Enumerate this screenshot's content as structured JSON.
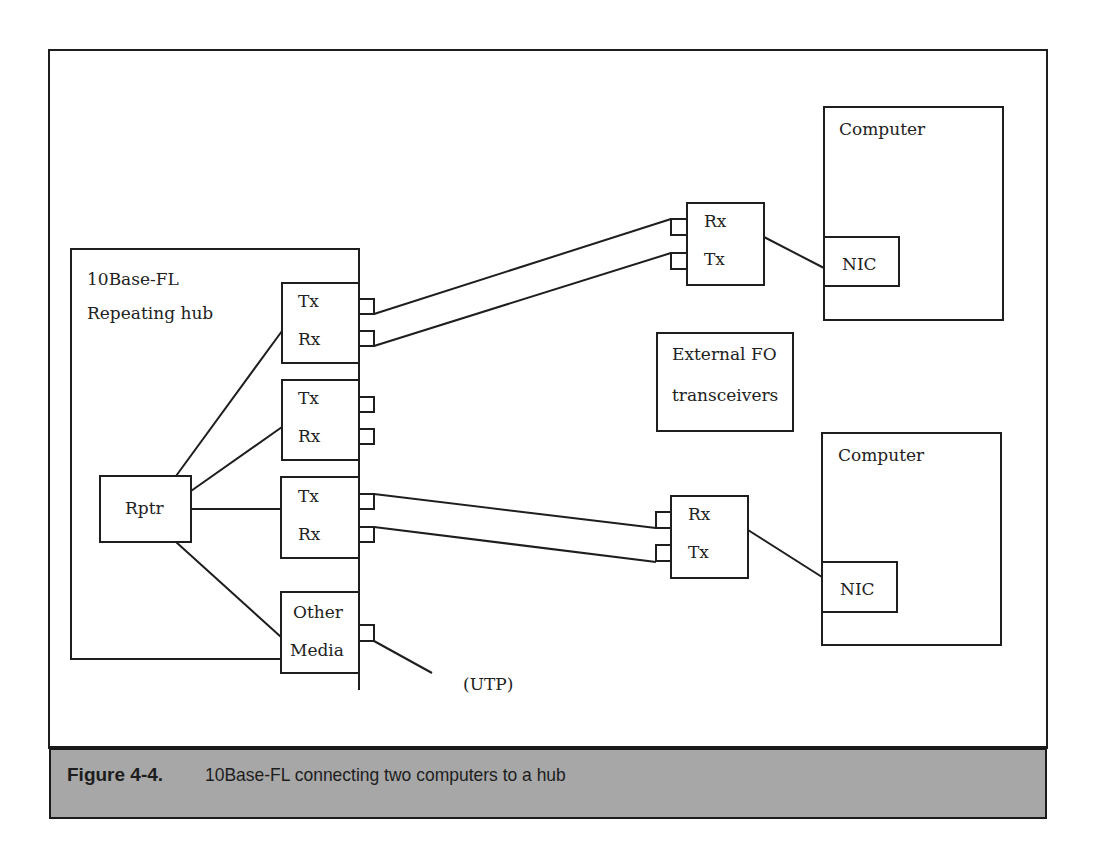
{
  "figure": {
    "number": "Figure 4-4.",
    "caption": "10Base-FL connecting two computers to a hub",
    "caption_bg": "#a7a7a7"
  },
  "hub": {
    "title_line1": "10Base-FL",
    "title_line2": "Repeating hub",
    "repeater_label": "Rptr",
    "modules": [
      {
        "line1": "Tx",
        "line2": "Rx"
      },
      {
        "line1": "Tx",
        "line2": "Rx"
      },
      {
        "line1": "Tx",
        "line2": "Rx"
      },
      {
        "line1": "Other",
        "line2": "Media"
      }
    ],
    "utp_label": "(UTP)"
  },
  "transceivers": {
    "note_line1": "External FO",
    "note_line2": "transceivers",
    "top": {
      "line1": "Rx",
      "line2": "Tx"
    },
    "bottom": {
      "line1": "Rx",
      "line2": "Tx"
    }
  },
  "computers": [
    {
      "label": "Computer",
      "nic_label": "NIC"
    },
    {
      "label": "Computer",
      "nic_label": "NIC"
    }
  ]
}
